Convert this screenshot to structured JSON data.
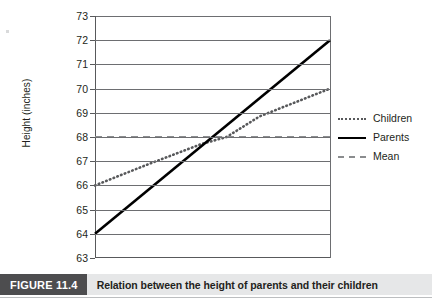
{
  "figure": {
    "tag": "FIGURE 11.4",
    "caption": "Relation between the height of parents and their children"
  },
  "chart_data": {
    "type": "line",
    "title": "",
    "xlabel": "",
    "ylabel": "Height (inches)",
    "ylim": [
      63,
      73
    ],
    "xlim": [
      0,
      1
    ],
    "grid": true,
    "legend_position": "right",
    "yticks": [
      73,
      72,
      71,
      70,
      69,
      68,
      67,
      66,
      65,
      64,
      63
    ],
    "ytick_labels": [
      "73",
      "72",
      "71",
      "70",
      "69",
      "68",
      "67",
      "66",
      "65",
      "64",
      "63"
    ],
    "xticks": [],
    "xtick_labels": [],
    "series": [
      {
        "name": "Children",
        "style": "dotted",
        "color": "#58595b",
        "x": [
          0.0,
          0.22,
          0.45,
          0.56,
          0.7,
          1.0
        ],
        "values": [
          66.0,
          66.85,
          67.7,
          68.0,
          68.85,
          70.0
        ]
      },
      {
        "name": "Parents",
        "style": "solid",
        "color": "#000000",
        "x": [
          0.0,
          1.0
        ],
        "values": [
          64.0,
          72.0
        ]
      },
      {
        "name": "Mean",
        "style": "dashed",
        "color": "#8a8c8e",
        "x": [
          0.0,
          1.0
        ],
        "values": [
          68.0,
          68.0
        ]
      }
    ],
    "annotations": [
      {
        "text": "Parents and Children lines intersect at the mean height of 68 inches"
      }
    ]
  },
  "legend": {
    "items": [
      {
        "label": "Children",
        "marker": "dotted-line-marker"
      },
      {
        "label": "Parents",
        "marker": "solid-line-marker"
      },
      {
        "label": "Mean",
        "marker": "dashed-line-marker"
      }
    ]
  }
}
